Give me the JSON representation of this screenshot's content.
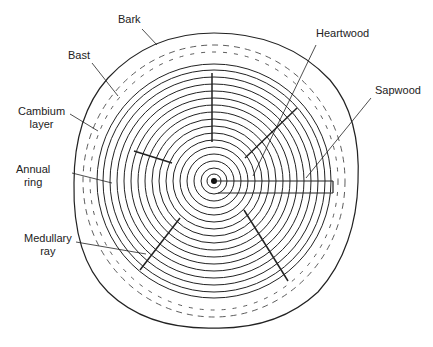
{
  "diagram": {
    "labels": {
      "bark": "Bark",
      "bast": "Bast",
      "cambium_line1": "Cambium",
      "cambium_line2": "layer",
      "annual_line1": "Annual",
      "annual_line2": "ring",
      "medullary_line1": "Medullary",
      "medullary_line2": "ray",
      "heartwood": "Heartwood",
      "sapwood": "Sapwood"
    },
    "colors": {
      "ink": "#222222",
      "background": "#ffffff"
    },
    "center": [
      214,
      181
    ],
    "ring_count": 17
  }
}
